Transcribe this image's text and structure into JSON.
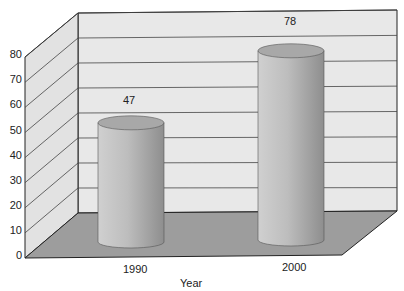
{
  "chart_data": {
    "type": "bar",
    "style": "3d-cylinder",
    "title": "",
    "xlabel": "Year",
    "ylabel": "",
    "categories": [
      "1990",
      "2000"
    ],
    "values": [
      47,
      78
    ],
    "data_labels": [
      "47",
      "78"
    ],
    "ylim": [
      0,
      80
    ],
    "yticks": [
      "0",
      "10",
      "20",
      "30",
      "40",
      "50",
      "60",
      "70",
      "80"
    ],
    "grid": true,
    "legend": null
  },
  "colors": {
    "wall": "#e6e6e6",
    "floor": "#9a9a9a",
    "bar": "#b8b8b8"
  }
}
